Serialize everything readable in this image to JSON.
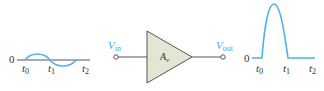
{
  "colors": {
    "waveform": "#4fb3e8",
    "axis": "#555555",
    "amp_fill": "#e4e6d4",
    "amp_stroke": "#555555",
    "terminal_label": "#4da6d9"
  },
  "input_waveform": {
    "zero_label": "0",
    "time_labels": [
      {
        "base": "t",
        "sub": "0"
      },
      {
        "base": "t",
        "sub": "1"
      },
      {
        "base": "t",
        "sub": "2"
      }
    ],
    "shape": "one full sine cycle"
  },
  "amplifier": {
    "input_label": {
      "base": "V",
      "sub": "in"
    },
    "output_label": {
      "base": "V",
      "sub": "out"
    },
    "gain_label": {
      "base": "A",
      "sub": "v"
    }
  },
  "output_waveform": {
    "zero_label": "0",
    "time_labels": [
      {
        "base": "t",
        "sub": "0"
      },
      {
        "base": "t",
        "sub": "1"
      },
      {
        "base": "t",
        "sub": "2"
      }
    ],
    "shape": "positive half-cycle pulse between t0 and t1, zero after"
  }
}
